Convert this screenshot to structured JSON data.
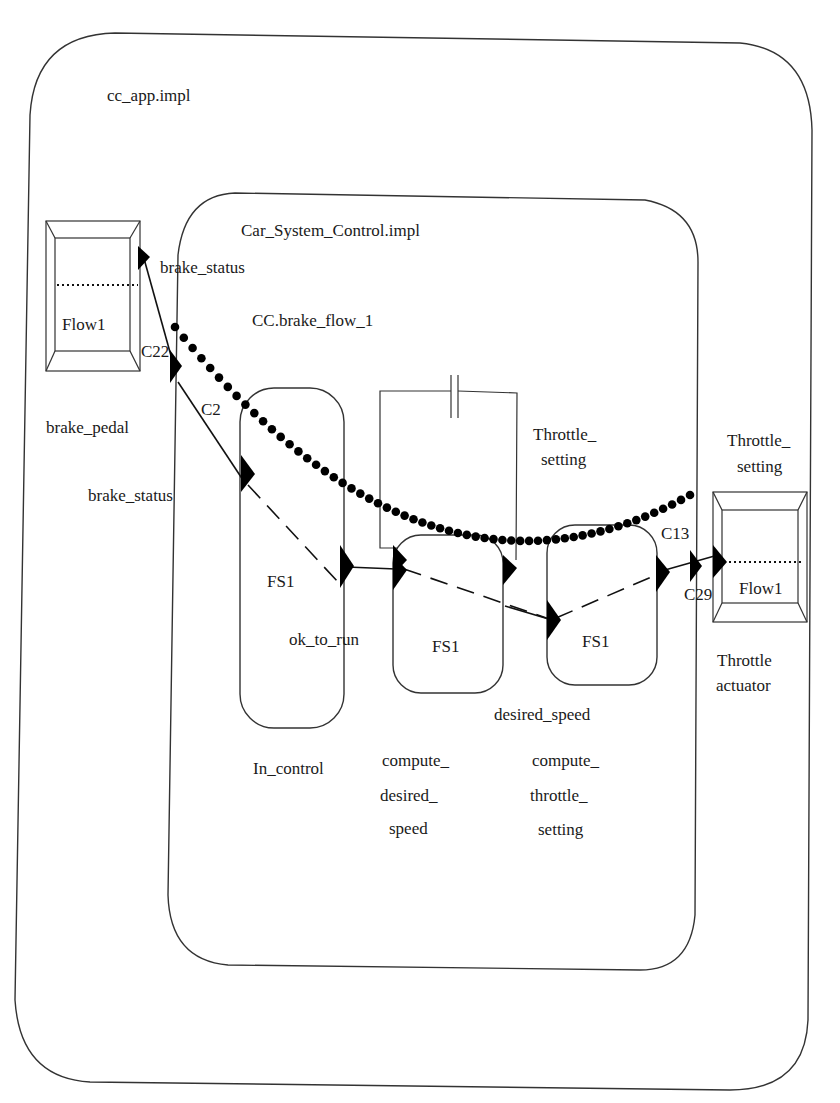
{
  "diagram": {
    "outer_system": {
      "label": "cc_app.impl"
    },
    "inner_system": {
      "label": "Car_System_Control.impl"
    },
    "flow_path_label": "CC.brake_flow_1",
    "left_device": {
      "flow_label": "Flow1",
      "name": "brake_pedal",
      "port_label": "brake_status"
    },
    "right_device": {
      "flow_label": "Flow1",
      "name_line1": "Throttle",
      "name_line2": "actuator",
      "port_label_line1": "Throttle_",
      "port_label_line2": "setting"
    },
    "connections": {
      "c22": "C22",
      "c2": "C2",
      "c13": "C13",
      "c29": "C29"
    },
    "processes": [
      {
        "flow_spec": "FS1",
        "name_lines": [
          "In_control"
        ]
      },
      {
        "flow_spec": "FS1",
        "name_lines": [
          "compute_",
          "desired_",
          "speed"
        ]
      },
      {
        "flow_spec": "FS1",
        "name_lines": [
          "compute_",
          "throttle_",
          "setting"
        ]
      }
    ],
    "port_labels": {
      "brake_status_inner": "brake_status",
      "ok_to_run": "ok_to_run",
      "desired_speed": "desired_speed",
      "throttle_setting_inner_line1": "Throttle_",
      "throttle_setting_inner_line2": "setting"
    },
    "colors": {
      "line": "#333333",
      "ink": "#000000",
      "background": "#ffffff"
    }
  }
}
